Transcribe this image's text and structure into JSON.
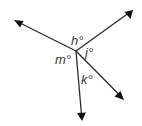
{
  "diagram": {
    "vertex": {
      "x": 76,
      "y": 51
    },
    "rays": [
      {
        "name": "upper-left",
        "end": {
          "x": 14,
          "y": 20
        }
      },
      {
        "name": "upper-right",
        "end": {
          "x": 133,
          "y": 10
        }
      },
      {
        "name": "lower-right",
        "end": {
          "x": 124,
          "y": 100
        }
      },
      {
        "name": "down",
        "end": {
          "x": 82,
          "y": 121
        }
      }
    ],
    "labels": {
      "h": "h°",
      "j": "j°",
      "k": "k°",
      "m": "m°"
    },
    "colors": {
      "line": "#2b2b2b",
      "arrow": "#111111",
      "text": "#3a3a3a",
      "background": "#ffffff"
    }
  }
}
